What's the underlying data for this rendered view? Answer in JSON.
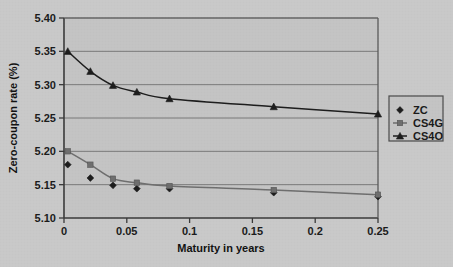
{
  "chart_data": {
    "type": "line",
    "title": "",
    "xlabel": "Maturity in years",
    "ylabel": "Zero-coupon rate (%)",
    "xlim": [
      0,
      0.25
    ],
    "ylim": [
      5.1,
      5.4
    ],
    "xticks": [
      "0",
      "0.05",
      "0.1",
      "0.15",
      "0.2",
      "0.25"
    ],
    "xtick_values": [
      0,
      0.05,
      0.1,
      0.15,
      0.2,
      0.25
    ],
    "yticks": [
      "5.10",
      "5.15",
      "5.20",
      "5.25",
      "5.30",
      "5.35",
      "5.40"
    ],
    "ytick_values": [
      5.1,
      5.15,
      5.2,
      5.25,
      5.3,
      5.35,
      5.4
    ],
    "grid": "horizontal",
    "legend_position": "right",
    "x": [
      0.003,
      0.021,
      0.039,
      0.058,
      0.084,
      0.167,
      0.25
    ],
    "series": [
      {
        "name": "ZC",
        "marker": "diamond",
        "line": "none",
        "color": "#1c1c1c",
        "values": [
          5.18,
          5.16,
          5.149,
          5.144,
          5.144,
          5.138,
          5.132
        ]
      },
      {
        "name": "CS4G",
        "marker": "square",
        "line": "solid",
        "color": "#6e6e6e",
        "values": [
          5.2,
          5.18,
          5.159,
          5.153,
          5.148,
          5.142,
          5.135
        ]
      },
      {
        "name": "CS4O",
        "marker": "triangle",
        "line": "solid",
        "color": "#1c1c1c",
        "values": [
          5.35,
          5.32,
          5.299,
          5.289,
          5.279,
          5.267,
          5.256
        ]
      }
    ]
  },
  "legend": {
    "entries": [
      {
        "label": "ZC"
      },
      {
        "label": "CS4G"
      },
      {
        "label": "CS4O"
      }
    ]
  },
  "colors": {
    "background": "#c9c9c9",
    "plot_background": "#c4c4c4",
    "axis": "#3a3a3a",
    "grid": "#6f6f6f",
    "zc": "#1c1c1c",
    "cs4g": "#6e6e6e",
    "cs4o": "#1c1c1c"
  }
}
